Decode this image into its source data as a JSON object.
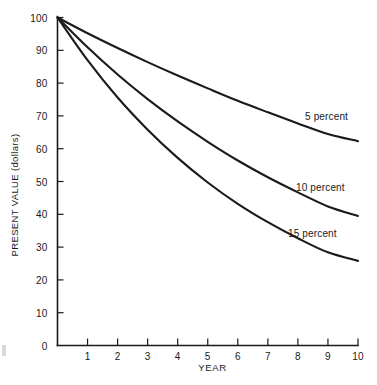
{
  "chart_data": {
    "type": "line",
    "title": "",
    "subtitle": "",
    "xlabel": "YEAR",
    "ylabel": "PRESENT VALUE (dollars)",
    "xlim": [
      0,
      10
    ],
    "ylim": [
      0,
      100
    ],
    "grid": false,
    "legend_position": "inline-right-of-curve",
    "x_tick_labels": [
      "1",
      "2",
      "3",
      "4",
      "5",
      "6",
      "7",
      "8",
      "9",
      "10"
    ],
    "x_ticks": [
      1,
      2,
      3,
      4,
      5,
      6,
      7,
      8,
      9,
      10
    ],
    "y_tick_labels": [
      "0",
      "10",
      "20",
      "30",
      "40",
      "50",
      "60",
      "70",
      "80",
      "90",
      "100"
    ],
    "y_ticks": [
      0,
      10,
      20,
      30,
      40,
      50,
      60,
      70,
      80,
      90,
      100
    ],
    "x": [
      0,
      1,
      2,
      3,
      4,
      5,
      6,
      7,
      8,
      9,
      10
    ],
    "series": [
      {
        "name": "5 percent",
        "label": "5 percent",
        "rate_percent": 5,
        "color": "#1a1a1a",
        "values": [
          100,
          95.2,
          90.7,
          86.4,
          82.3,
          78.4,
          74.6,
          71.1,
          67.7,
          64.5,
          62.3
        ]
      },
      {
        "name": "10 percent",
        "label": "10 percent",
        "rate_percent": 10,
        "color": "#1a1a1a",
        "values": [
          100,
          90.9,
          82.6,
          75.1,
          68.3,
          62.1,
          56.4,
          51.3,
          46.7,
          42.4,
          39.5
        ]
      },
      {
        "name": "15 percent",
        "label": "15 percent",
        "rate_percent": 15,
        "color": "#1a1a1a",
        "values": [
          100,
          87.0,
          75.6,
          65.8,
          57.2,
          49.7,
          43.2,
          37.6,
          32.7,
          28.4,
          25.8
        ]
      }
    ]
  },
  "axis_titles": {
    "x": "YEAR",
    "y": "PRESENT VALUE (dollars)"
  }
}
